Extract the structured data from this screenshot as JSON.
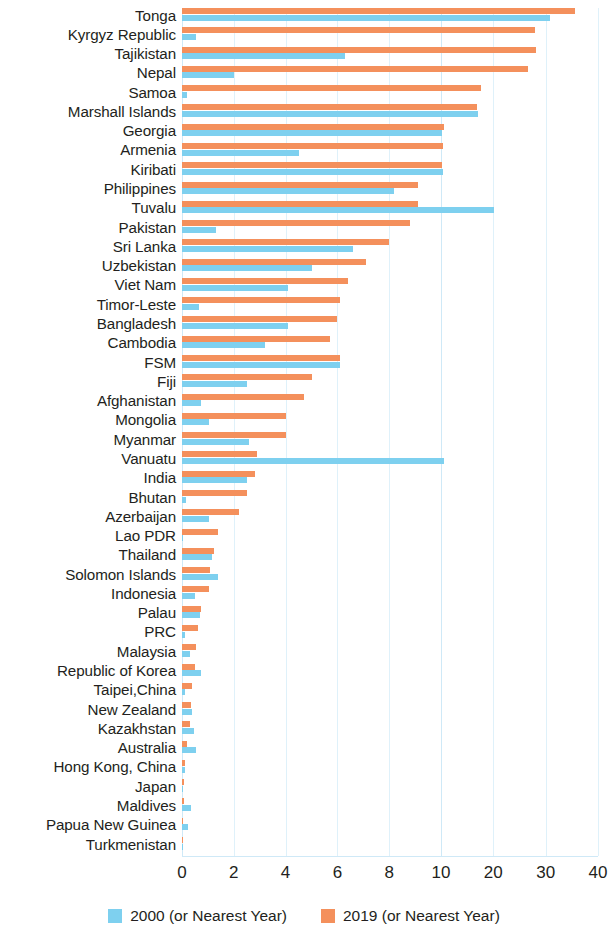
{
  "chart_data": {
    "type": "bar",
    "orientation": "horizontal",
    "title": "",
    "subtitle": "",
    "xlabel": "",
    "ylabel": "",
    "grid": true,
    "legend_position": "bottom",
    "xticks": [
      0,
      2,
      4,
      6,
      8,
      10,
      20,
      30,
      40
    ],
    "xtick_labels": [
      "0",
      "2",
      "4",
      "6",
      "8",
      "10",
      "20",
      "30",
      "40"
    ],
    "xlim": [
      0,
      40
    ],
    "axis_note": "piecewise-linear: 0-10 expanded, 10-40 compressed",
    "categories": [
      "Tonga",
      "Kyrgyz Republic",
      "Tajikistan",
      "Nepal",
      "Samoa",
      "Marshall Islands",
      "Georgia",
      "Armenia",
      "Kiribati",
      "Philippines",
      "Tuvalu",
      "Pakistan",
      "Sri Lanka",
      "Uzbekistan",
      "Viet Nam",
      "Timor-Leste",
      "Bangladesh",
      "Cambodia",
      "FSM",
      "Fiji",
      "Afghanistan",
      "Mongolia",
      "Myanmar",
      "Vanuatu",
      "India",
      "Bhutan",
      "Azerbaijan",
      "Lao PDR",
      "Thailand",
      "Solomon Islands",
      "Indonesia",
      "Palau",
      "PRC",
      "Malaysia",
      "Republic of Korea",
      "Taipei,China",
      "New Zealand",
      "Kazakhstan",
      "Australia",
      "Hong Kong, China",
      "Japan",
      "Maldives",
      "Papua New Guinea",
      "Turkmenistan"
    ],
    "series": [
      {
        "name": "2019 (or Nearest Year)",
        "color": "#f4905c",
        "values": [
          35.6,
          28.0,
          28.1,
          26.7,
          17.6,
          16.9,
          10.6,
          10.4,
          10.1,
          9.1,
          9.1,
          8.8,
          8.0,
          7.1,
          6.4,
          6.1,
          6.0,
          5.7,
          6.1,
          5.0,
          4.7,
          4.0,
          4.0,
          2.9,
          2.8,
          2.5,
          2.2,
          1.4,
          1.25,
          1.1,
          1.05,
          0.75,
          0.6,
          0.55,
          0.5,
          0.4,
          0.35,
          0.3,
          0.2,
          0.12,
          0.08,
          0.08,
          0.05,
          0.02
        ]
      },
      {
        "name": "2000 (or Nearest Year)",
        "color": "#7ed0ef",
        "values": [
          30.8,
          0.55,
          6.3,
          2.0,
          0.2,
          17.0,
          10.2,
          4.5,
          10.4,
          8.2,
          20.1,
          1.3,
          6.6,
          5.0,
          4.1,
          0.65,
          4.1,
          3.2,
          6.1,
          2.5,
          0.75,
          1.05,
          2.6,
          10.5,
          2.5,
          0.15,
          1.05,
          0.05,
          1.15,
          1.4,
          0.5,
          0.7,
          0.1,
          0.3,
          0.75,
          0.12,
          0.4,
          0.45,
          0.55,
          0.1,
          0.05,
          0.35,
          0.25,
          0.04
        ]
      }
    ]
  },
  "legend": {
    "items": [
      {
        "label": "2000 (or Nearest Year)",
        "color": "#7ed0ef",
        "key": "s2000"
      },
      {
        "label": "2019 (or Nearest Year)",
        "color": "#f4905c",
        "key": "s2019"
      }
    ]
  },
  "colors": {
    "series_2000": "#7ed0ef",
    "series_2019": "#f4905c",
    "grid": "#dff1fa",
    "text": "#231f20",
    "background": "#ffffff"
  }
}
